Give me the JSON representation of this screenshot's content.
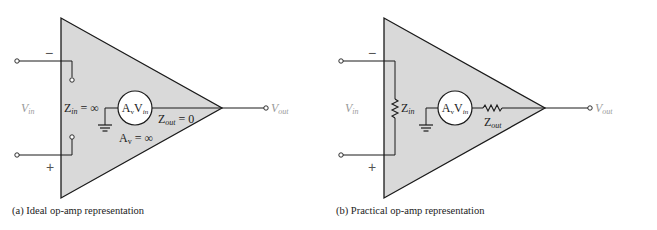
{
  "colors": {
    "triangle_fill": "#d9d9d9",
    "stroke": "#1a1a1a",
    "terminal_label": "#9a9a9a"
  },
  "panel_a": {
    "caption": "(a) Ideal op-amp representation",
    "minus_sign": "−",
    "plus_sign": "+",
    "vin": {
      "main": "V",
      "sub": "in"
    },
    "zin": {
      "main": "Z",
      "sub": "in",
      "rest": " = ∞"
    },
    "source": {
      "a": "A",
      "a_sub": "v",
      "v": "V",
      "v_sub": "in"
    },
    "zout": {
      "main": "Z",
      "sub": "out",
      "rest": " = 0"
    },
    "av": {
      "main": "A",
      "sub": "v",
      "rest": " = ∞"
    },
    "vout": {
      "main": "V",
      "sub": "out"
    }
  },
  "panel_b": {
    "caption": "(b) Practical op-amp representation",
    "minus_sign": "−",
    "plus_sign": "+",
    "vin": {
      "main": "V",
      "sub": "in"
    },
    "zin": {
      "main": "Z",
      "sub": "in"
    },
    "source": {
      "a": "A",
      "a_sub": "v",
      "v": "V",
      "v_sub": "in"
    },
    "zout": {
      "main": "Z",
      "sub": "out"
    },
    "vout": {
      "main": "V",
      "sub": "out"
    }
  }
}
